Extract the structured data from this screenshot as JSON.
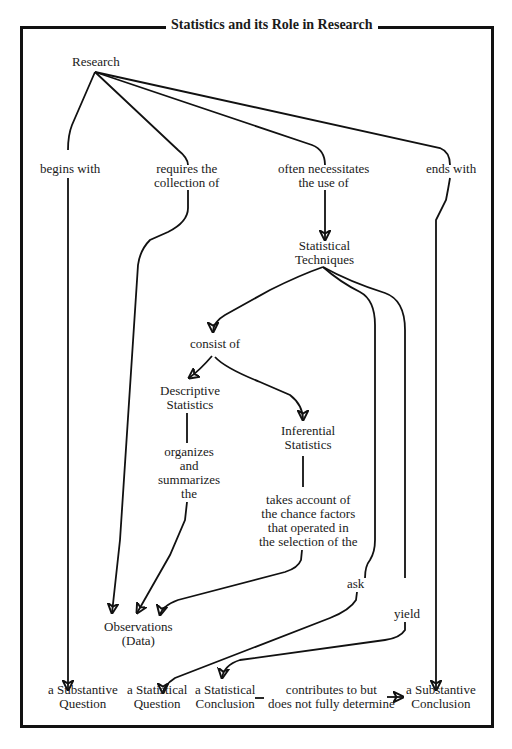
{
  "title": "Statistics and its Role in Research",
  "nodes": {
    "research": "Research",
    "begins_with": "begins with",
    "requires_1": "requires the",
    "requires_2": "collection of",
    "often_1": "often necessitates",
    "often_2": "the use of",
    "ends_with": "ends with",
    "stat_tech_1": "Statistical",
    "stat_tech_2": "Techniques",
    "consist_of": "consist of",
    "descriptive_1": "Descriptive",
    "descriptive_2": "Statistics",
    "inferential_1": "Inferential",
    "inferential_2": "Statistics",
    "organizes_1": "organizes",
    "organizes_2": "and",
    "organizes_3": "summarizes",
    "organizes_4": "the",
    "takes_1": "takes account of",
    "takes_2": "the chance factors",
    "takes_3": "that operated in",
    "takes_4": "the selection of the",
    "ask": "ask",
    "yield": "yield",
    "observations_1": "Observations",
    "observations_2": "(Data)",
    "subst_question_1": "a Substantive",
    "subst_question_2": "Question",
    "stat_question_1": "a Statistical",
    "stat_question_2": "Question",
    "stat_conclusion_1": "a Statistical",
    "stat_conclusion_2": "Conclusion",
    "contributes_1": "contributes to but",
    "contributes_2": "does not fully determine",
    "subst_conclusion_1": "a Substantive",
    "subst_conclusion_2": "Conclusion"
  },
  "colors": {
    "ink": "#111111",
    "background": "#ffffff"
  }
}
